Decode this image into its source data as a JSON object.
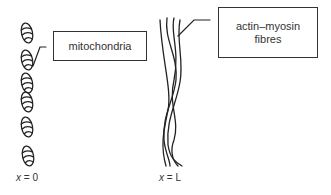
{
  "diagram": {
    "labels": {
      "mitochondria": "mitochondria",
      "fibres_line1": "actin–myosin",
      "fibres_line2": "fibres"
    },
    "axis": {
      "left_var": "x",
      "left_eq": " = 0",
      "right_var": "x",
      "right_eq": " = L"
    },
    "mitochondria_count": 6,
    "stroke_color": "#222222"
  }
}
